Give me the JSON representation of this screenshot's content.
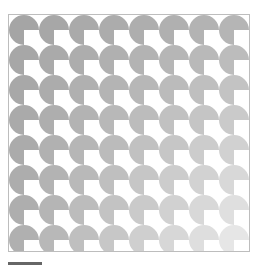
{
  "pattern": {
    "rows": 8,
    "cols": 8,
    "tile_size": 30,
    "shape": "circle-with-bottom-right-quadrant-removed",
    "colors": {
      "top_left": "#a5a5a5",
      "top_right": "#b5b5b5",
      "bottom_left": "#b0b0b0",
      "bottom_right": "#e6e6e6",
      "background": "#ffffff",
      "frame_border": "#bdbdbd"
    }
  },
  "scale_bar": {
    "color": "#666666"
  }
}
